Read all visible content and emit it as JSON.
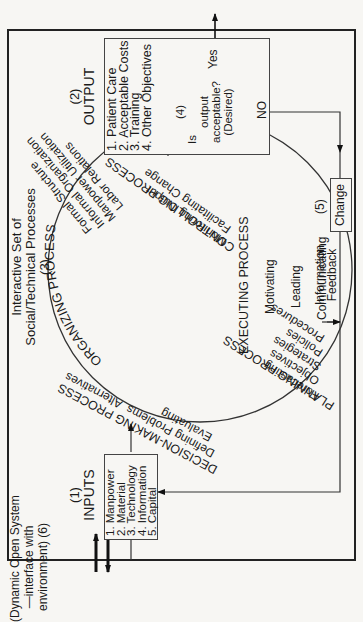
{
  "environment": {
    "label_line1": "(Dynamic Open System",
    "label_line2": "—interface with",
    "label_line3": "environment) (6)"
  },
  "inputs": {
    "number": "(1)",
    "title": "INPUTS",
    "items": [
      "1. Manpower",
      "2. Material",
      "3. Technology",
      "4. Information",
      "5. Capital"
    ]
  },
  "processes": {
    "header_line1": "Interactive Set of",
    "header_line2": "Social/Technical Processes",
    "number": "(3)",
    "organizing": {
      "title": "ORGANIZING PROCESS",
      "items": [
        "Formal Structure",
        "Informal Organization",
        "Manpower Utilization",
        "Labor Relations"
      ]
    },
    "decision_making": {
      "title": "DECISION-MAKING PROCESS",
      "items": [
        "Defining Problems",
        "Alternatives",
        "Evaluating"
      ]
    },
    "controlling": {
      "title": "CONTROLLING PROCESS",
      "items": [
        "Monitoring Output",
        "Facilitating Change"
      ]
    },
    "planning": {
      "title": "PLANNING PROCESS",
      "items": [
        "Forecasting",
        "Objectives",
        "Strategies",
        "Policies",
        "Procedures"
      ]
    },
    "executing": {
      "title": "EXECUTING PROCESS",
      "items": [
        "Motivating",
        "Leading",
        "Communicating"
      ]
    }
  },
  "output": {
    "number": "(2)",
    "title": "OUTPUT",
    "items": [
      "1. Patient Care",
      "2. Acceptable Costs",
      "3. Training",
      "4. Other Objectives"
    ]
  },
  "decision": {
    "number": "(4)",
    "line1": "Is",
    "line2": "output",
    "line3": "acceptable?",
    "line4": "(Desired)",
    "yes_label": "Yes",
    "no_label": "NO"
  },
  "feedback": {
    "number": "(5)",
    "change_label": "Change",
    "info_line1": "Information",
    "info_line2": "Feedback"
  },
  "colors": {
    "background": "#f7f6f3",
    "line": "#222222",
    "text": "#1a1a1a"
  }
}
